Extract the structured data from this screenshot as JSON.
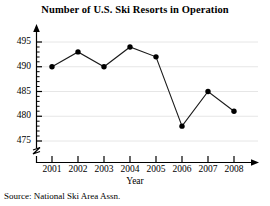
{
  "chart_data": {
    "type": "line",
    "title": "Number of U.S. Ski Resorts in Operation",
    "xlabel": "Year",
    "ylabel": "",
    "categories": [
      "2001",
      "2002",
      "2003",
      "2004",
      "2005",
      "2006",
      "2007",
      "2008"
    ],
    "values": [
      490,
      493,
      490,
      494,
      492,
      478,
      485,
      481
    ],
    "series": [
      {
        "name": "U.S. Ski Resorts in Operation",
        "values": [
          490,
          493,
          490,
          494,
          492,
          478,
          485,
          481
        ]
      }
    ],
    "ylim": [
      475,
      495
    ],
    "yticks": [
      475,
      480,
      485,
      490,
      495
    ],
    "ytick_labels": [
      "475",
      "480",
      "485",
      "490",
      "495"
    ],
    "xtick_labels": [
      "2001",
      "2002",
      "2003",
      "2004",
      "2005",
      "2006",
      "2007",
      "2008"
    ],
    "grid": true,
    "grid_axis": "y",
    "legend": false,
    "legend_position": "none",
    "axis_break": true,
    "marker": "filled-circle",
    "line_color": "#000000",
    "marker_color": "#000000",
    "grid_color": "#e2e2e2",
    "axis_color": "#000000",
    "background": "#ffffff",
    "source": "Source: National Ski Area Assn.",
    "annotations": [
      "y-axis has an upward arrowhead",
      "x-axis has a rightward arrowhead",
      "y-axis is broken below 475"
    ]
  }
}
